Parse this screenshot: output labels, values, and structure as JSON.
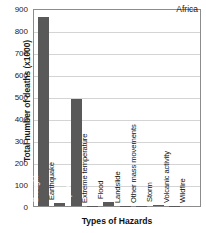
{
  "chart_data": {
    "type": "bar",
    "title": "",
    "annotation": "Africa",
    "xlabel": "Types of Hazards",
    "ylabel": "Total number of deaths (x1000)",
    "ylim": [
      0,
      900
    ],
    "ytick_labels": [
      "900",
      "800",
      "700",
      "600",
      "500",
      "400",
      "300",
      "200",
      "100",
      "0"
    ],
    "ytick_values": [
      900,
      800,
      700,
      600,
      500,
      400,
      300,
      200,
      100,
      0
    ],
    "grid": true,
    "legend": "none",
    "bar_color": "#595959",
    "categories": [
      "Drought",
      "Earthquake",
      "Epidemic",
      "Extreme temperature",
      "Flood",
      "Landslide",
      "Other mass movements",
      "Storm",
      "Volcanic activity",
      "Wildfire"
    ],
    "values": [
      860,
      15,
      485,
      2,
      20,
      1,
      1,
      5,
      1,
      0
    ],
    "label_placement": [
      "inside",
      "outside",
      "inside",
      "outside",
      "outside",
      "outside",
      "outside",
      "outside",
      "outside",
      "outside"
    ]
  }
}
